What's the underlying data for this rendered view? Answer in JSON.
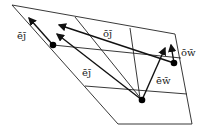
{
  "diagram": {
    "labels": {
      "ej_left": "ēj̄",
      "oj": "ōj̄",
      "ow": "ōw̄",
      "ej_mid": "ēj̄",
      "ew": "ēw̄"
    },
    "colors": {
      "ink": "#111111",
      "background": "#ffffff"
    },
    "nodes": [
      "dot-left",
      "dot-right",
      "dot-bottom"
    ],
    "arrows": [
      {
        "name": "arrow-ej-left",
        "from": "dot-left",
        "label": "ēj̄"
      },
      {
        "name": "arrow-ej-mid",
        "from": "dot-bottom",
        "label": "ēj̄"
      },
      {
        "name": "arrow-oj",
        "from": "dot-right",
        "label": "ōj̄"
      },
      {
        "name": "arrow-ew",
        "from": "dot-bottom",
        "label": "ēw̄"
      },
      {
        "name": "arrow-ow",
        "from": "dot-right",
        "label": "ōw̄"
      }
    ]
  }
}
